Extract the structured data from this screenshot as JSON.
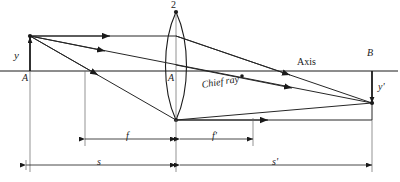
{
  "figure": {
    "type": "optics-ray-diagram"
  },
  "labels": {
    "object_height": "y",
    "image_height": "y'",
    "object_point_axis": "A",
    "lens_vertex": "A",
    "lens_top": "2",
    "image_point_axis": "B",
    "axis": "Axis",
    "chief_ray": "Chief ray",
    "front_focal": "f",
    "back_focal": "f'",
    "object_distance": "s",
    "image_distance": "s'"
  },
  "geometry": {
    "axis_y": 71,
    "object_x": 30,
    "object_tip_y": 36,
    "lens_x": 176,
    "lens_top_y": 12,
    "lens_bottom_y": 120,
    "image_x": 372,
    "image_tip_y": 104,
    "front_focal_x": 85,
    "back_focal_x": 253,
    "dim_f_y": 139,
    "dim_s_y": 165,
    "s_left_x": 26,
    "axis_right_x": 398
  },
  "colors": {
    "ink": "#1a1a1a",
    "ray": "#262626",
    "construction": "#555555",
    "background": "#ffffff"
  }
}
